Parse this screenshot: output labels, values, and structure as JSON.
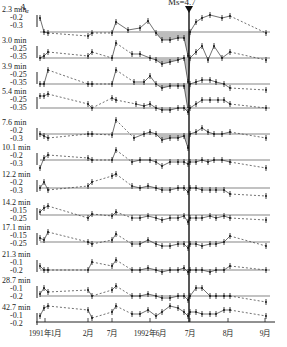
{
  "chart_data": {
    "type": "line",
    "title": "",
    "ylabel": "A_α",
    "xlabel": "",
    "annotation": {
      "text": "Ms=4.7",
      "x_label": "1992年7月 (earthquake)",
      "marker": "down-arrow"
    },
    "x_ticks": [
      "1991年1月",
      "2月",
      "7月",
      "1992年6月",
      "7月",
      "8月",
      "9月"
    ],
    "x_tick_px": [
      45,
      88,
      112,
      150,
      190,
      228,
      265
    ],
    "quake_x_px": 189,
    "series": [
      {
        "name": "2.3 min",
        "yticks": [
          "-0.2",
          "-0.3"
        ],
        "label_y": 12,
        "baseline_y": 32,
        "shaded": true,
        "points": [
          [
            40,
            18
          ],
          [
            44,
            32
          ],
          [
            48,
            33
          ],
          [
            88,
            36
          ],
          [
            92,
            33
          ],
          [
            112,
            33
          ],
          [
            116,
            22
          ],
          [
            128,
            30
          ],
          [
            140,
            28
          ],
          [
            148,
            21
          ],
          [
            156,
            33
          ],
          [
            162,
            40
          ],
          [
            170,
            40
          ],
          [
            178,
            38
          ],
          [
            184,
            38
          ],
          [
            188,
            56
          ],
          [
            190,
            32
          ],
          [
            196,
            22
          ],
          [
            202,
            18
          ],
          [
            210,
            15
          ],
          [
            222,
            18
          ],
          [
            230,
            16
          ],
          [
            266,
            33
          ]
        ]
      },
      {
        "name": "3.0 min",
        "yticks": [
          "-0.25",
          "-0.35"
        ],
        "label_y": 43,
        "baseline_y": 58,
        "shaded": true,
        "points": [
          [
            40,
            58
          ],
          [
            44,
            56
          ],
          [
            48,
            52
          ],
          [
            88,
            56
          ],
          [
            92,
            52
          ],
          [
            112,
            58
          ],
          [
            116,
            43
          ],
          [
            132,
            54
          ],
          [
            140,
            54
          ],
          [
            150,
            58
          ],
          [
            156,
            60
          ],
          [
            162,
            64
          ],
          [
            170,
            62
          ],
          [
            178,
            60
          ],
          [
            184,
            58
          ],
          [
            188,
            82
          ],
          [
            190,
            58
          ],
          [
            196,
            52
          ],
          [
            202,
            46
          ],
          [
            208,
            60
          ],
          [
            214,
            46
          ],
          [
            222,
            58
          ],
          [
            230,
            52
          ],
          [
            266,
            60
          ]
        ]
      },
      {
        "name": "3.9 min",
        "yticks": [
          "-0.25",
          "-0.35"
        ],
        "label_y": 69,
        "baseline_y": 84,
        "shaded": true,
        "points": [
          [
            40,
            84
          ],
          [
            44,
            84
          ],
          [
            48,
            70
          ],
          [
            88,
            84
          ],
          [
            92,
            84
          ],
          [
            112,
            84
          ],
          [
            116,
            70
          ],
          [
            134,
            82
          ],
          [
            144,
            82
          ],
          [
            150,
            76
          ],
          [
            156,
            84
          ],
          [
            162,
            88
          ],
          [
            170,
            86
          ],
          [
            178,
            86
          ],
          [
            184,
            86
          ],
          [
            188,
            110
          ],
          [
            190,
            84
          ],
          [
            196,
            82
          ],
          [
            202,
            80
          ],
          [
            210,
            80
          ],
          [
            216,
            82
          ],
          [
            224,
            84
          ],
          [
            230,
            88
          ],
          [
            266,
            90
          ]
        ]
      },
      {
        "name": "5.4 min",
        "yticks": [
          "-0.25",
          "-0.35"
        ],
        "label_y": 94,
        "baseline_y": 108,
        "shaded": true,
        "points": [
          [
            40,
            96
          ],
          [
            44,
            96
          ],
          [
            48,
            94
          ],
          [
            88,
            104
          ],
          [
            92,
            108
          ],
          [
            112,
            98
          ],
          [
            116,
            100
          ],
          [
            136,
            104
          ],
          [
            144,
            106
          ],
          [
            150,
            104
          ],
          [
            156,
            108
          ],
          [
            162,
            110
          ],
          [
            170,
            110
          ],
          [
            178,
            108
          ],
          [
            184,
            108
          ],
          [
            188,
            112
          ],
          [
            190,
            108
          ],
          [
            196,
            104
          ],
          [
            202,
            100
          ],
          [
            210,
            100
          ],
          [
            218,
            100
          ],
          [
            224,
            100
          ],
          [
            230,
            104
          ],
          [
            266,
            108
          ]
        ]
      },
      {
        "name": "7.6 min",
        "yticks": [
          "-0.2",
          "-0.3"
        ],
        "label_y": 125,
        "baseline_y": 134,
        "shaded": true,
        "points": [
          [
            40,
            134
          ],
          [
            44,
            136
          ],
          [
            48,
            138
          ],
          [
            88,
            134
          ],
          [
            92,
            134
          ],
          [
            112,
            135
          ],
          [
            116,
            120
          ],
          [
            134,
            138
          ],
          [
            144,
            134
          ],
          [
            150,
            132
          ],
          [
            156,
            134
          ],
          [
            162,
            140
          ],
          [
            170,
            138
          ],
          [
            178,
            138
          ],
          [
            184,
            136
          ],
          [
            188,
            148
          ],
          [
            190,
            134
          ],
          [
            196,
            132
          ],
          [
            202,
            128
          ],
          [
            208,
            132
          ],
          [
            214,
            134
          ],
          [
            222,
            134
          ],
          [
            230,
            132
          ],
          [
            266,
            138
          ]
        ]
      },
      {
        "name": "10.1 min",
        "yticks": [
          "-0.2",
          "-0.3"
        ],
        "label_y": 150,
        "baseline_y": 160,
        "shaded": false,
        "points": [
          [
            40,
            168
          ],
          [
            44,
            158
          ],
          [
            48,
            155
          ],
          [
            88,
            158
          ],
          [
            92,
            160
          ],
          [
            112,
            160
          ],
          [
            116,
            150
          ],
          [
            132,
            162
          ],
          [
            140,
            160
          ],
          [
            150,
            160
          ],
          [
            156,
            162
          ],
          [
            162,
            166
          ],
          [
            170,
            162
          ],
          [
            178,
            162
          ],
          [
            184,
            162
          ],
          [
            188,
            164
          ],
          [
            190,
            162
          ],
          [
            196,
            162
          ],
          [
            202,
            160
          ],
          [
            208,
            162
          ],
          [
            214,
            160
          ],
          [
            222,
            160
          ],
          [
            230,
            162
          ],
          [
            266,
            168
          ]
        ]
      },
      {
        "name": "12.2 min",
        "yticks": [
          "-0.2",
          "-0.3"
        ],
        "label_y": 177,
        "baseline_y": 188,
        "shaded": false,
        "points": [
          [
            40,
            188
          ],
          [
            44,
            182
          ],
          [
            48,
            190
          ],
          [
            88,
            186
          ],
          [
            92,
            182
          ],
          [
            112,
            176
          ],
          [
            116,
            174
          ],
          [
            132,
            186
          ],
          [
            140,
            188
          ],
          [
            148,
            186
          ],
          [
            156,
            188
          ],
          [
            162,
            190
          ],
          [
            170,
            190
          ],
          [
            178,
            188
          ],
          [
            184,
            188
          ],
          [
            188,
            192
          ],
          [
            190,
            188
          ],
          [
            196,
            188
          ],
          [
            202,
            190
          ],
          [
            210,
            190
          ],
          [
            216,
            190
          ],
          [
            224,
            190
          ],
          [
            230,
            194
          ],
          [
            266,
            196
          ]
        ]
      },
      {
        "name": "14.2 min",
        "yticks": [
          "-0.15",
          "-0.25"
        ],
        "label_y": 205,
        "baseline_y": 215,
        "shaded": false,
        "points": [
          [
            40,
            212
          ],
          [
            44,
            208
          ],
          [
            48,
            206
          ],
          [
            88,
            218
          ],
          [
            92,
            214
          ],
          [
            112,
            216
          ],
          [
            116,
            212
          ],
          [
            132,
            218
          ],
          [
            140,
            218
          ],
          [
            148,
            216
          ],
          [
            156,
            218
          ],
          [
            162,
            220
          ],
          [
            170,
            218
          ],
          [
            178,
            218
          ],
          [
            184,
            216
          ],
          [
            188,
            222
          ],
          [
            190,
            218
          ],
          [
            196,
            218
          ],
          [
            202,
            218
          ],
          [
            210,
            216
          ],
          [
            216,
            218
          ],
          [
            224,
            216
          ],
          [
            230,
            218
          ],
          [
            266,
            220
          ]
        ]
      },
      {
        "name": "17.1 min",
        "yticks": [
          "-0.15",
          "-0.25"
        ],
        "label_y": 230,
        "baseline_y": 242,
        "shaded": false,
        "points": [
          [
            40,
            238
          ],
          [
            44,
            240
          ],
          [
            48,
            232
          ],
          [
            88,
            242
          ],
          [
            92,
            244
          ],
          [
            112,
            240
          ],
          [
            116,
            234
          ],
          [
            132,
            244
          ],
          [
            140,
            244
          ],
          [
            148,
            240
          ],
          [
            156,
            244
          ],
          [
            162,
            246
          ],
          [
            170,
            246
          ],
          [
            178,
            244
          ],
          [
            184,
            244
          ],
          [
            188,
            248
          ],
          [
            190,
            244
          ],
          [
            196,
            244
          ],
          [
            202,
            246
          ],
          [
            210,
            244
          ],
          [
            216,
            244
          ],
          [
            224,
            242
          ],
          [
            230,
            236
          ],
          [
            266,
            246
          ]
        ]
      },
      {
        "name": "21.3 min",
        "yticks": [
          "-0.1",
          "-0.2"
        ],
        "label_y": 257,
        "baseline_y": 270,
        "shaded": false,
        "points": [
          [
            40,
            266
          ],
          [
            44,
            270
          ],
          [
            48,
            270
          ],
          [
            88,
            270
          ],
          [
            92,
            262
          ],
          [
            112,
            266
          ],
          [
            116,
            260
          ],
          [
            132,
            270
          ],
          [
            140,
            270
          ],
          [
            148,
            268
          ],
          [
            156,
            270
          ],
          [
            162,
            272
          ],
          [
            170,
            270
          ],
          [
            178,
            270
          ],
          [
            184,
            268
          ],
          [
            188,
            272
          ],
          [
            190,
            270
          ],
          [
            196,
            270
          ],
          [
            202,
            270
          ],
          [
            210,
            272
          ],
          [
            216,
            270
          ],
          [
            224,
            270
          ],
          [
            230,
            266
          ],
          [
            266,
            270
          ]
        ]
      },
      {
        "name": "28.7 min",
        "yticks": [
          "-0.1",
          "-0.2"
        ],
        "label_y": 283,
        "baseline_y": 296,
        "shaded": false,
        "points": [
          [
            40,
            294
          ],
          [
            44,
            288
          ],
          [
            48,
            292
          ],
          [
            88,
            290
          ],
          [
            92,
            296
          ],
          [
            112,
            290
          ],
          [
            116,
            286
          ],
          [
            132,
            296
          ],
          [
            140,
            296
          ],
          [
            148,
            294
          ],
          [
            156,
            296
          ],
          [
            162,
            298
          ],
          [
            170,
            298
          ],
          [
            178,
            296
          ],
          [
            184,
            296
          ],
          [
            188,
            300
          ],
          [
            190,
            296
          ],
          [
            196,
            288
          ],
          [
            202,
            288
          ],
          [
            210,
            296
          ],
          [
            216,
            296
          ],
          [
            224,
            296
          ],
          [
            230,
            296
          ],
          [
            266,
            302
          ]
        ]
      },
      {
        "name": "42.7 min",
        "yticks": [
          "-0.1",
          "-0.2"
        ],
        "label_y": 310,
        "baseline_y": 322,
        "shaded": false,
        "points": [
          [
            40,
            316
          ],
          [
            44,
            308
          ],
          [
            48,
            306
          ],
          [
            88,
            310
          ],
          [
            92,
            318
          ],
          [
            112,
            312
          ],
          [
            116,
            306
          ],
          [
            132,
            314
          ],
          [
            140,
            314
          ],
          [
            148,
            310
          ],
          [
            156,
            316
          ],
          [
            162,
            312
          ],
          [
            170,
            306
          ],
          [
            178,
            308
          ],
          [
            184,
            312
          ],
          [
            188,
            316
          ],
          [
            190,
            312
          ],
          [
            196,
            312
          ],
          [
            202,
            314
          ],
          [
            210,
            314
          ],
          [
            216,
            314
          ],
          [
            224,
            310
          ],
          [
            230,
            310
          ],
          [
            266,
            316
          ]
        ]
      }
    ]
  }
}
